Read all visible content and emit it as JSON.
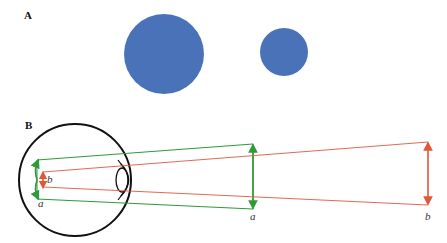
{
  "panel_a": {
    "label": "A",
    "circles": [
      {
        "name": "large-disc",
        "cx": 164,
        "cy": 54,
        "r": 40,
        "color": "#4a72b8"
      },
      {
        "name": "small-disc",
        "cx": 284,
        "cy": 52,
        "r": 24,
        "color": "#4a72b8"
      }
    ]
  },
  "panel_b": {
    "label": "B",
    "colors": {
      "near_object": "#2e9a3a",
      "far_object": "#e0583a",
      "eye_outline": "#111111"
    },
    "labels": {
      "retina_a": "a",
      "retina_b": "b",
      "object_a": "a",
      "object_b": "b"
    }
  }
}
